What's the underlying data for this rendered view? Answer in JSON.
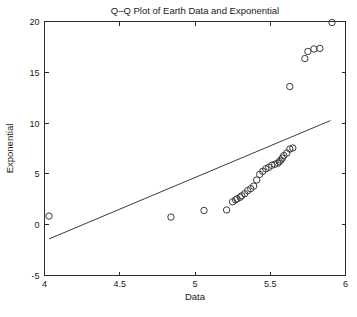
{
  "chart_data": {
    "type": "scatter",
    "title": "Q–Q Plot of Earth Data and Exponential",
    "xlabel": "Data",
    "ylabel": "Exponential",
    "xlim": [
      4,
      6
    ],
    "ylim": [
      -5,
      20
    ],
    "xticks": [
      4,
      4.5,
      5,
      5.5,
      6
    ],
    "xticklabels": [
      "4",
      "4.5",
      "5",
      "5.5",
      "6"
    ],
    "yticks": [
      -5,
      0,
      5,
      10,
      15,
      20
    ],
    "yticklabels": [
      "-5",
      "0",
      "5",
      "10",
      "15",
      "20"
    ],
    "grid": false,
    "legend": null,
    "marker": "open-circle",
    "marker_color": "#3a3a3a",
    "line_color": "#3a3a3a",
    "series": [
      {
        "name": "Quantile pairs",
        "x": [
          4.03,
          4.84,
          5.06,
          5.21,
          5.25,
          5.27,
          5.28,
          5.3,
          5.31,
          5.33,
          5.35,
          5.37,
          5.39,
          5.41,
          5.43,
          5.45,
          5.47,
          5.49,
          5.51,
          5.53,
          5.55,
          5.56,
          5.57,
          5.58,
          5.59,
          5.61,
          5.63,
          5.65,
          5.63,
          5.73,
          5.75,
          5.79,
          5.83,
          5.91
        ],
        "y": [
          0.85,
          0.75,
          1.4,
          1.45,
          2.25,
          2.45,
          2.55,
          2.7,
          2.85,
          3.05,
          3.35,
          3.55,
          3.8,
          4.4,
          4.95,
          5.25,
          5.5,
          5.65,
          5.85,
          5.95,
          6.05,
          6.2,
          6.35,
          6.55,
          6.8,
          7.05,
          7.45,
          7.55,
          13.6,
          16.35,
          17.05,
          17.3,
          17.35,
          19.9
        ]
      }
    ],
    "reference_line": {
      "name": "Reference line",
      "x": [
        4.03,
        5.9
      ],
      "y": [
        -1.4,
        10.25
      ]
    }
  }
}
